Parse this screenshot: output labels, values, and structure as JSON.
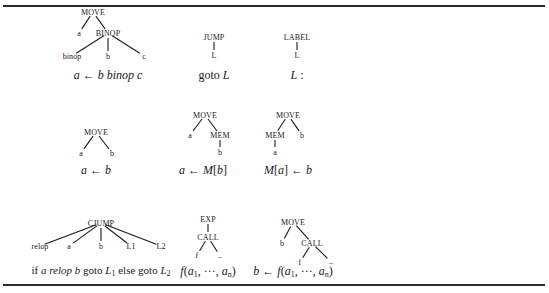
{
  "trees": [
    {
      "id": "move-binop",
      "nodes": [
        {
          "label": "MOVE",
          "x": 93,
          "y": 12
        },
        {
          "label": "a",
          "x": 79,
          "y": 33
        },
        {
          "label": "BINOP",
          "x": 108,
          "y": 33
        },
        {
          "label": "binop",
          "x": 72,
          "y": 56
        },
        {
          "label": "b",
          "x": 108,
          "y": 56
        },
        {
          "label": "c",
          "x": 144,
          "y": 56
        }
      ],
      "edges": [
        [
          0,
          1
        ],
        [
          0,
          2
        ],
        [
          2,
          3
        ],
        [
          2,
          4
        ],
        [
          2,
          5
        ]
      ],
      "formula": {
        "text": "a ← b binop c",
        "x": 108,
        "y": 75
      }
    },
    {
      "id": "jump",
      "nodes": [
        {
          "label": "JUMP",
          "x": 214,
          "y": 37
        },
        {
          "label": "L",
          "x": 214,
          "y": 55
        }
      ],
      "edges": [
        [
          0,
          1
        ]
      ],
      "formula": {
        "text": "goto L",
        "x": 214,
        "y": 75
      }
    },
    {
      "id": "label",
      "nodes": [
        {
          "label": "LABEL",
          "x": 297,
          "y": 37
        },
        {
          "label": "L",
          "x": 297,
          "y": 55
        }
      ],
      "edges": [
        [
          0,
          1
        ]
      ],
      "formula": {
        "text": "L :",
        "x": 297,
        "y": 75
      }
    },
    {
      "id": "move-simple",
      "nodes": [
        {
          "label": "MOVE",
          "x": 96,
          "y": 132
        },
        {
          "label": "a",
          "x": 81,
          "y": 153
        },
        {
          "label": "b",
          "x": 112,
          "y": 153
        }
      ],
      "edges": [
        [
          0,
          1
        ],
        [
          0,
          2
        ]
      ],
      "formula": {
        "text": "a ← b",
        "x": 96,
        "y": 170
      }
    },
    {
      "id": "move-load",
      "nodes": [
        {
          "label": "MOVE",
          "x": 205,
          "y": 115
        },
        {
          "label": "a",
          "x": 190,
          "y": 135
        },
        {
          "label": "MEM",
          "x": 220,
          "y": 135
        },
        {
          "label": "b",
          "x": 220,
          "y": 152
        }
      ],
      "edges": [
        [
          0,
          1
        ],
        [
          0,
          2
        ],
        [
          2,
          3
        ]
      ],
      "formula": {
        "text": "a ← M[b]",
        "x": 203,
        "y": 170
      }
    },
    {
      "id": "move-store",
      "nodes": [
        {
          "label": "MOVE",
          "x": 288,
          "y": 115
        },
        {
          "label": "MEM",
          "x": 275,
          "y": 135
        },
        {
          "label": "b",
          "x": 302,
          "y": 135
        },
        {
          "label": "a",
          "x": 275,
          "y": 152
        }
      ],
      "edges": [
        [
          0,
          1
        ],
        [
          0,
          2
        ],
        [
          1,
          3
        ]
      ],
      "formula": {
        "text": "M[a] ← b",
        "x": 288,
        "y": 170
      }
    },
    {
      "id": "cjump",
      "nodes": [
        {
          "label": "CJUMP",
          "x": 101,
          "y": 223
        },
        {
          "label": "relop",
          "x": 40,
          "y": 246
        },
        {
          "label": "a",
          "x": 69,
          "y": 246
        },
        {
          "label": "b",
          "x": 101,
          "y": 246
        },
        {
          "label": "L1",
          "x": 131,
          "y": 246
        },
        {
          "label": "L2",
          "x": 161,
          "y": 246
        }
      ],
      "edges": [
        [
          0,
          1
        ],
        [
          0,
          2
        ],
        [
          0,
          3
        ],
        [
          0,
          4
        ],
        [
          0,
          5
        ]
      ],
      "formula": {
        "text": "if a relop b goto L1 else goto L2",
        "x": 101,
        "y": 271
      }
    },
    {
      "id": "exp-call",
      "nodes": [
        {
          "label": "EXP",
          "x": 208,
          "y": 219
        },
        {
          "label": "CALL",
          "x": 208,
          "y": 237
        },
        {
          "label": "f",
          "x": 197,
          "y": 255
        },
        {
          "label": "–",
          "x": 220,
          "y": 256
        }
      ],
      "edges": [
        [
          0,
          1
        ],
        [
          1,
          2
        ],
        [
          1,
          3
        ]
      ],
      "formula": {
        "text": "f(a1, ···, an)",
        "x": 208,
        "y": 271
      }
    },
    {
      "id": "move-call",
      "nodes": [
        {
          "label": "MOVE",
          "x": 293,
          "y": 222
        },
        {
          "label": "b",
          "x": 282,
          "y": 243
        },
        {
          "label": "CALL",
          "x": 312,
          "y": 243
        },
        {
          "label": "f",
          "x": 300,
          "y": 262
        },
        {
          "label": "–",
          "x": 331,
          "y": 262
        }
      ],
      "edges": [
        [
          0,
          1
        ],
        [
          0,
          2
        ],
        [
          2,
          3
        ],
        [
          2,
          4
        ]
      ],
      "formula": {
        "text": "b ← f(a1, ···, an)",
        "x": 293,
        "y": 271
      }
    }
  ],
  "formulas_display": {
    "move_binop": {
      "a": "a",
      "arrow": " ← ",
      "b": "b",
      "op": " binop ",
      "c": "c"
    },
    "jump": {
      "kw": "goto ",
      "L": "L"
    },
    "label": {
      "L": "L",
      "colon": " :"
    },
    "move_simple": {
      "a": "a",
      "arrow": " ← ",
      "b": "b"
    },
    "move_load": {
      "a": "a",
      "arrow": " ← ",
      "M": "M",
      "open": "[",
      "b": "b",
      "close": "]"
    },
    "move_store": {
      "M": "M",
      "open": "[",
      "a": "a",
      "close": "]",
      "arrow": " ← ",
      "b": "b"
    },
    "cjump": {
      "if": "if ",
      "a": "a",
      "relop": " relop ",
      "b": "b",
      "goto1": " goto ",
      "L": "L",
      "s1": "1",
      "else": " else goto ",
      "L2": "L",
      "s2": "2"
    },
    "exp_call": {
      "f": "f",
      "open": "(",
      "a": "a",
      "s1": "1",
      "mid": ", ···, ",
      "a2": "a",
      "sn": "n",
      "close": ")"
    },
    "move_call": {
      "b": "b",
      "arrow": " ← ",
      "f": "f",
      "open": "(",
      "a": "a",
      "s1": "1",
      "mid": ", ···, ",
      "a2": "a",
      "sn": "n",
      "close": ")"
    }
  }
}
